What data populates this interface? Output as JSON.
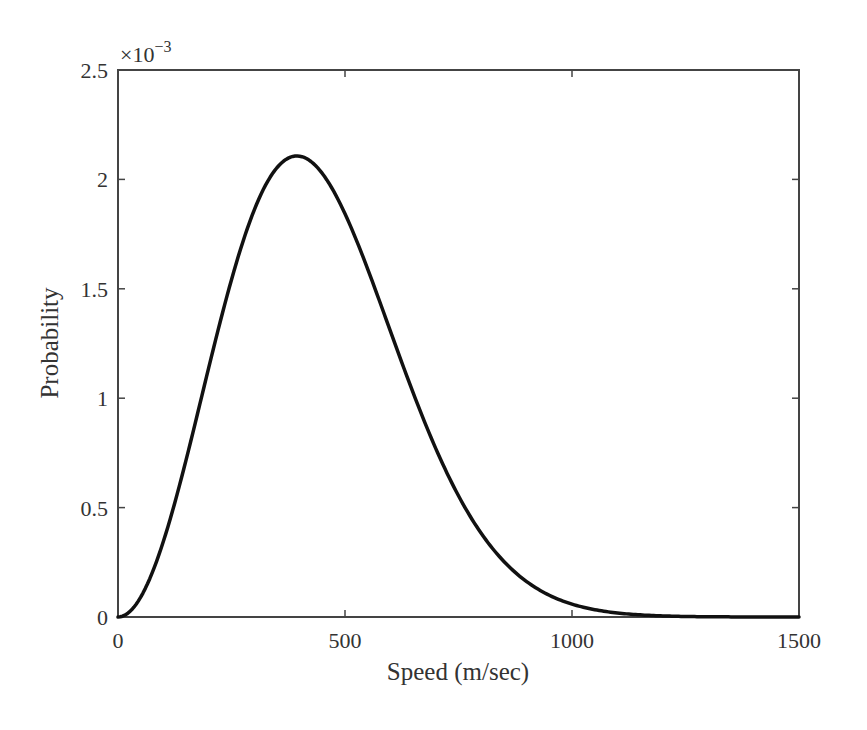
{
  "chart_data": {
    "type": "line",
    "title": "",
    "xlabel": "Speed (m/sec)",
    "ylabel": "Probability",
    "y_exponent_label": "×10",
    "y_exponent_power": "−3",
    "xlim": [
      0,
      1500
    ],
    "ylim": [
      0,
      0.0025
    ],
    "xticks": [
      0,
      500,
      1000,
      1500
    ],
    "xtick_labels": [
      "0",
      "500",
      "1000",
      "1500"
    ],
    "yticks": [
      0,
      0.0005,
      0.001,
      0.0015,
      0.002,
      0.0025
    ],
    "ytick_labels": [
      "0",
      "0.5",
      "1",
      "1.5",
      "2",
      "2.5"
    ],
    "grid": false,
    "legend": null,
    "series": [
      {
        "name": "Maxwell-Boltzmann speed distribution",
        "color": "#111111",
        "x": [
          0,
          50,
          100,
          150,
          200,
          250,
          300,
          350,
          394,
          450,
          500,
          550,
          600,
          650,
          700,
          750,
          800,
          850,
          900,
          950,
          1000,
          1050,
          1100,
          1150,
          1200,
          1250,
          1300,
          1350,
          1400,
          1450,
          1500
        ],
        "values": [
          0.0,
          9e-05,
          0.000341,
          0.000702,
          0.001104,
          0.001482,
          0.001781,
          0.001985,
          0.002107,
          0.00204,
          0.001905,
          0.001703,
          0.001458,
          0.001196,
          0.000942,
          0.000713,
          0.000381,
          0.00027,
          0.000181,
          0.000116,
          7.1e-05,
          4.1e-05,
          2.3e-05,
          1.2e-05,
          6e-06,
          3e-06,
          1e-06,
          0.0,
          0.0,
          0.0,
          0.0
        ]
      }
    ]
  }
}
